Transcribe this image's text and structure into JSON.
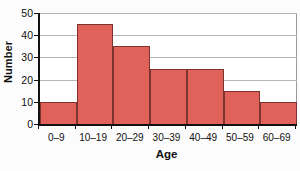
{
  "chart_data": {
    "type": "bar",
    "title": "",
    "subtitle": "",
    "xlabel": "Age",
    "ylabel": "Number",
    "categories": [
      "0–9",
      "10–19",
      "20–29",
      "30–39",
      "40–49",
      "50–59",
      "60–69"
    ],
    "values": [
      10,
      45,
      35,
      25,
      25,
      15,
      10
    ],
    "ylim": [
      0,
      50
    ],
    "yticks": [
      0,
      10,
      20,
      30,
      40,
      50
    ],
    "ytick_labels": [
      "0",
      "10",
      "20",
      "30",
      "40",
      "50"
    ],
    "grid": "horizontal",
    "legend": "none",
    "bar_color": "#e0625b",
    "bar_edge_color": "#7d3330",
    "axis_color": "#111111",
    "gridline_color": "#b6b6b6",
    "plot_background": "#ffffff",
    "figure_background": "#fcfcfc",
    "annotations": []
  }
}
